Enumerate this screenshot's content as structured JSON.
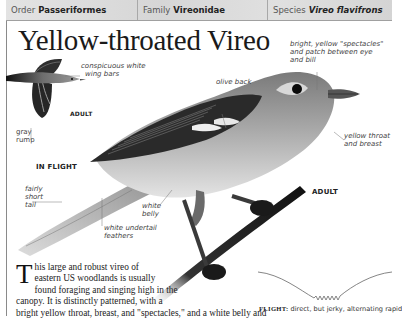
{
  "header": {
    "order_label": "Order",
    "order_value": "Passeriformes",
    "family_label": "Family",
    "family_value": "Vireonidae",
    "species_label": "Species",
    "species_value": "Vireo flavifrons"
  },
  "title": "Yellow-throated Vireo",
  "inflight": {
    "labels": {
      "wing_bars_1": "conspicuous white",
      "wing_bars_2": "wing bars",
      "adult": "ADULT",
      "rump_1": "gray",
      "rump_2": "rump",
      "caption": "IN FLIGHT"
    }
  },
  "adult": {
    "labels": {
      "spectacles_1": "bright, yellow \"spectacles\"",
      "spectacles_2": "and patch between eye",
      "spectacles_3": "and bill",
      "olive_back": "olive back",
      "throat_1": "yellow throat",
      "throat_2": "and breast",
      "tail_1": "fairly",
      "tail_2": "short",
      "tail_3": "tail",
      "belly_1": "white",
      "belly_2": "belly",
      "undertail_1": "white undertail",
      "undertail_2": "feathers",
      "caption": "ADULT"
    }
  },
  "description": {
    "dropcap": "T",
    "line1": "his large and robust vireo of",
    "line2": "eastern US woodlands is usually",
    "line3": "found foraging and singing high in the",
    "line4": "canopy. It is distinctly patterned, with a",
    "line5": "bright yellow throat, breast, and \"spectacles,\" and a white belly and"
  },
  "flight": {
    "label": "FLIGHT:",
    "text": "direct, but jerky, alternating rapid"
  }
}
